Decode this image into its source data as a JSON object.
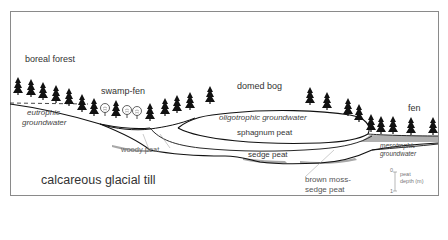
{
  "diagram": {
    "title": "",
    "labels": {
      "boreal_forest": "boreal forest",
      "swamp_fen": "swamp-fen",
      "domed_bog": "domed bog",
      "fen": "fen",
      "eutrophic_groundwater_1": "eutrophic",
      "eutrophic_groundwater_2": "groundwater",
      "oligotrophic_groundwater": "oligotrophic groundwater",
      "sphagnum_peat": "sphagnum peat",
      "woody_peat": "woody peat",
      "sedge_peat": "sedge peat",
      "mesotrophic_groundwater_1": "mesotrophic",
      "mesotrophic_groundwater_2": "groundwater",
      "brown_moss_1": "brown moss-",
      "brown_moss_2": "sedge peat",
      "calcareous_till": "calcareous glacial till"
    },
    "scale": {
      "top_tick": "0",
      "bottom_tick": "1",
      "label_1": "peat",
      "label_2": "depth (m)"
    },
    "colors": {
      "outline": "#1a1a1a",
      "peat_shade": "#a8a8a8",
      "frame": "#8a8a8a",
      "text": "#333333"
    }
  }
}
